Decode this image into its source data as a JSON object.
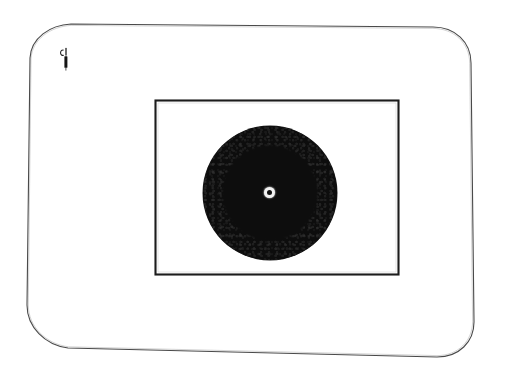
{
  "figure": {
    "background_color": "#ffffff",
    "ink_color": "#333333"
  },
  "plate_frame": {
    "name": "rounded plate outline",
    "stroke_color": "#4a4a4a",
    "stroke_width": 1,
    "corner_radius": 42,
    "bounds": {
      "left": 28,
      "top": 22,
      "right": 478,
      "bottom": 358
    }
  },
  "image_frame": {
    "name": "inner rectangular image border",
    "stroke_color": "#1c1c1c",
    "stroke_width": 2,
    "bounds": {
      "left": 155,
      "top": 100,
      "right": 398,
      "bottom": 274
    },
    "width": 243,
    "height": 174
  },
  "disc": {
    "name": "dark textured disc",
    "fill_color": "#0d0d0d",
    "edge_texture": "grainy",
    "center_x": 270,
    "center_y": 193,
    "diameter": 134,
    "radius": 67
  },
  "center_marker": {
    "name": "bullseye center mark",
    "ring_color": "#f2f2f2",
    "dot_color": "#101010",
    "center_x": 269,
    "center_y": 192,
    "outer_diameter": 11,
    "inner_diameter": 5
  },
  "annotation": {
    "name": "hand-inked corner mark",
    "ink_color": "#1f1f1f",
    "position_x": 58,
    "position_y": 46,
    "width": 16,
    "height": 26,
    "description": "small loop above short vertical bar"
  },
  "caption": {
    "alt_text": "Scanned plate: dark circular disc centered inside a rectangular image border on a rounded plate outline, with a small ink mark near the upper left corner."
  }
}
